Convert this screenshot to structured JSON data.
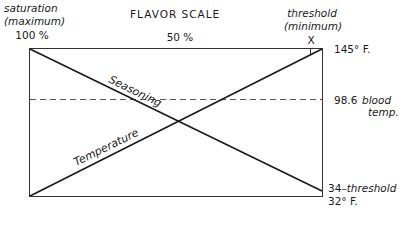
{
  "title": "FLAVOR SCALE",
  "scale_labels": {
    "left_title": "saturation",
    "left_sub": "(maximum)",
    "left_value": "100 %",
    "middle_value": "50 %",
    "right_title": "threshold",
    "right_sub": "(minimum)",
    "right_value": "X"
  },
  "right_labels": {
    "top": "145° F.",
    "blood_value": "98.6",
    "blood_text1": "blood",
    "blood_text2": "temp.",
    "bottom_value": "34",
    "bottom_text": "–threshold",
    "bottom_temp": "32° F."
  },
  "lines": {
    "seasoning": "Seasoning",
    "temperature": "Temperature"
  },
  "colors": {
    "line": "#1a1a1a",
    "box": "#333333",
    "dash": "#555555"
  }
}
